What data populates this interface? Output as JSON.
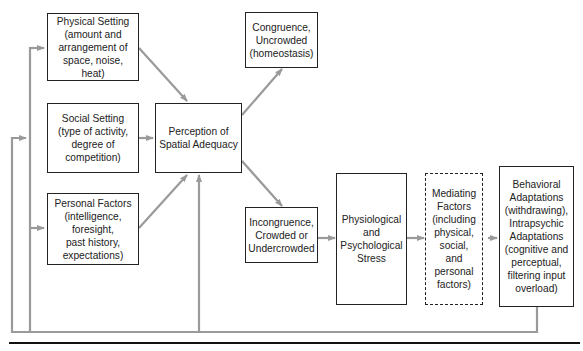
{
  "diagram": {
    "nodes": [
      {
        "id": "physical",
        "label": "Physical Setting (amount and arrangement of space, noise, heat)",
        "lines": [
          "Physical Setting",
          "(amount and",
          "arrangement of",
          "space, noise, heat)"
        ]
      },
      {
        "id": "social",
        "label": "Social Setting (type of activity, degree of competition)",
        "lines": [
          "Social Setting",
          "(type of activity,",
          "degree of",
          "competition)"
        ]
      },
      {
        "id": "personal",
        "label": "Personal Factors (intelligence, foresight, past history, expectations)",
        "lines": [
          "Personal Factors",
          "(intelligence,",
          "foresight,",
          "past history,",
          "expectations)"
        ]
      },
      {
        "id": "perception",
        "label": "Perception of Spatial Adequacy",
        "lines": [
          "Perception of",
          "Spatial Adequacy"
        ]
      },
      {
        "id": "congruence",
        "label": "Congruence, Uncrowded (homeostasis)",
        "lines": [
          "Congruence,",
          "Uncrowded",
          "(homeostasis)"
        ]
      },
      {
        "id": "incongruence",
        "label": "Incongruence, Crowded or Undercrowded",
        "lines": [
          "Incongruence,",
          "Crowded or",
          "Undercrowded"
        ]
      },
      {
        "id": "stress",
        "label": "Physiological and Psychological Stress",
        "lines": [
          "Physiological",
          "and",
          "Psychological",
          "Stress"
        ]
      },
      {
        "id": "mediating",
        "label": "Mediating Factors (including physical, social, and personal factors)",
        "lines": [
          "Mediating",
          "Factors",
          "(including",
          "physical,",
          "social,",
          "and",
          "personal",
          "factors)"
        ],
        "style": "dashed"
      },
      {
        "id": "behavioral",
        "label": "Behavioral Adaptations (withdrawing), Intrapsychic Adaptations (cognitive and perceptual, filtering input overload)",
        "lines": [
          "Behavioral",
          "Adaptations",
          "(withdrawing),",
          "Intrapsychic",
          "Adaptations",
          "(cognitive and",
          "perceptual,",
          "filtering input",
          "overload)"
        ]
      }
    ],
    "edges": [
      {
        "from": "physical",
        "to": "perception"
      },
      {
        "from": "social",
        "to": "perception"
      },
      {
        "from": "personal",
        "to": "perception"
      },
      {
        "from": "perception",
        "to": "congruence"
      },
      {
        "from": "perception",
        "to": "incongruence"
      },
      {
        "from": "incongruence",
        "to": "stress"
      },
      {
        "from": "stress",
        "to": "mediating"
      },
      {
        "from": "mediating",
        "to": "behavioral"
      },
      {
        "from": "behavioral",
        "to": "physical",
        "type": "feedback"
      },
      {
        "from": "behavioral",
        "to": "social",
        "type": "feedback"
      },
      {
        "from": "behavioral",
        "to": "personal",
        "type": "feedback"
      },
      {
        "from": "behavioral",
        "to": "perception",
        "type": "feedback"
      }
    ],
    "colors": {
      "box_border": "#222222",
      "arrow": "#9a9a9a",
      "rule": "#111111"
    }
  }
}
